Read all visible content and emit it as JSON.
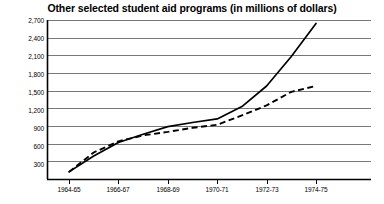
{
  "chart_data": {
    "type": "line",
    "title": "Other selected student aid programs (in millions of dollars)",
    "xlabel": "",
    "ylabel": "",
    "categories": [
      "1964-65",
      "1965-66",
      "1966-67",
      "1967-68",
      "1968-69",
      "1969-70",
      "1970-71",
      "1971-72",
      "1972-73",
      "1973-74",
      "1974-75"
    ],
    "x_tick_labels": [
      "1964-65",
      "1966-67",
      "1968-69",
      "1970-71",
      "1972-73",
      "1974-75"
    ],
    "y_tick_labels": [
      "300",
      "600",
      "900",
      "1,200",
      "1,500",
      "1,800",
      "2,100",
      "2,400",
      "2,700"
    ],
    "y_tick_values": [
      300,
      600,
      900,
      1200,
      1500,
      1800,
      2100,
      2400,
      2700
    ],
    "ylim": [
      0,
      2700
    ],
    "grid": true,
    "legend": "none",
    "series": [
      {
        "name": "solid-series",
        "style": "solid",
        "color": "#000000",
        "values": [
          120,
          390,
          620,
          760,
          890,
          960,
          1020,
          1230,
          1580,
          2080,
          2640
        ]
      },
      {
        "name": "dashed-series",
        "style": "dashed",
        "color": "#000000",
        "values": [
          120,
          450,
          640,
          740,
          800,
          870,
          920,
          1080,
          1250,
          1480,
          1580
        ]
      }
    ]
  },
  "axis": {
    "y_axis_name": "y-axis",
    "x_axis_name": "x-axis"
  }
}
